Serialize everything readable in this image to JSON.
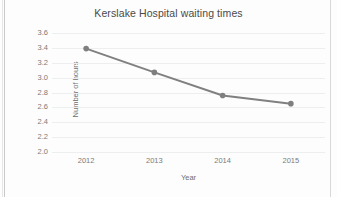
{
  "chart_data": {
    "type": "line",
    "title": "Kerslake Hospital waiting times",
    "xlabel": "Year",
    "ylabel": "Number of hours",
    "categories": [
      "2012",
      "2013",
      "2014",
      "2015"
    ],
    "values": [
      3.39,
      3.07,
      2.76,
      2.65
    ],
    "series": [
      {
        "name": "Number of hours",
        "values": [
          3.39,
          3.07,
          2.76,
          2.65
        ]
      }
    ],
    "ylim": [
      2.0,
      3.6
    ],
    "ytick_step": 0.2,
    "yticks": [
      "3.6",
      "3.4",
      "3.2",
      "3.0",
      "2.8",
      "2.6",
      "2.4",
      "2.2",
      "2.0"
    ],
    "ytick_values": [
      3.6,
      3.4,
      3.2,
      3.0,
      2.8,
      2.6,
      2.4,
      2.2,
      2.0
    ],
    "grid": true,
    "legend": false,
    "legend_position": "none",
    "marker": "circle",
    "line_color": "#808080",
    "marker_color": "#7f7f7f",
    "gridline_color": "#eceef0",
    "text_color": "#6f6f6f",
    "title_color": "#4a4a4a",
    "background_color": "#ffffff"
  }
}
